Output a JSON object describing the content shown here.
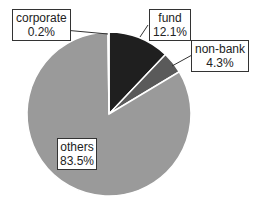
{
  "chart_data": {
    "type": "pie",
    "title": "",
    "slices": [
      {
        "label": "fund",
        "value": 12.1,
        "display": "12.1%",
        "color": "#1f1f1f"
      },
      {
        "label": "non-bank",
        "value": 4.3,
        "display": "4.3%",
        "color": "#5a5a5a"
      },
      {
        "label": "others",
        "value": 83.5,
        "display": "83.5%",
        "color": "#9a9a9a"
      },
      {
        "label": "corporate",
        "value": 0.2,
        "display": "0.2%",
        "color": "#bdbdbd"
      }
    ],
    "start_angle": "12 o'clock, clockwise",
    "legend": "none (data labels with leader lines)"
  },
  "labels": {
    "corporate": {
      "name": "corporate",
      "pct": "0.2%"
    },
    "fund": {
      "name": "fund",
      "pct": "12.1%"
    },
    "nonbank": {
      "name": "non-bank",
      "pct": "4.3%"
    },
    "others": {
      "name": "others",
      "pct": "83.5%"
    }
  }
}
